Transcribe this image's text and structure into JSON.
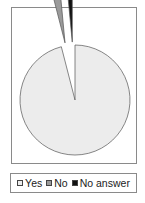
{
  "chart_data": {
    "type": "pie",
    "title": "",
    "categories": [
      "Yes",
      "No",
      "No answer"
    ],
    "values": [
      96,
      2.5,
      1.5
    ],
    "unit": "%",
    "colors": [
      "#ececec",
      "#9a9a9a",
      "#111111"
    ],
    "exploded": [
      "No",
      "No answer"
    ],
    "legend_position": "bottom"
  },
  "legend": {
    "items": [
      {
        "label": "Yes",
        "color": "#ececec"
      },
      {
        "label": "No",
        "color": "#9a9a9a"
      },
      {
        "label": "No answer",
        "color": "#111111"
      }
    ]
  }
}
